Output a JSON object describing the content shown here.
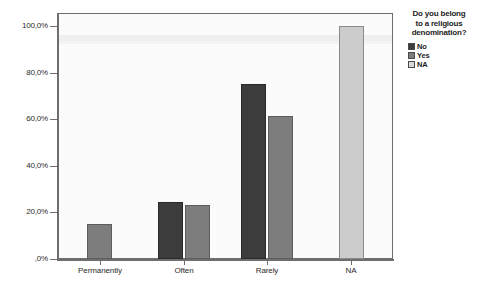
{
  "chart_data": {
    "type": "bar",
    "title": "",
    "xlabel": "",
    "ylabel": "",
    "categories": [
      "Permanently",
      "Often",
      "Rarely",
      "NA"
    ],
    "series": [
      {
        "name": "No",
        "color": "#3c3c3c",
        "values": [
          null,
          24.5,
          75.0,
          null
        ]
      },
      {
        "name": "Yes",
        "color": "#7d7d7d",
        "values": [
          15.0,
          23.0,
          61.5,
          null
        ]
      },
      {
        "name": "NA",
        "color": "#cccccc",
        "values": [
          null,
          null,
          null,
          100.0
        ]
      }
    ],
    "ylim": [
      0,
      100
    ],
    "yticks": [
      0,
      20,
      40,
      60,
      80,
      100
    ],
    "ytick_labels": [
      ",0%",
      "20,0%",
      "40,0%",
      "60,0%",
      "80,0%",
      "100,0%"
    ],
    "grid": false,
    "legend_position": "right"
  },
  "legend": {
    "title_lines": [
      "Do you belong",
      "to a religious",
      "denomination?"
    ],
    "entries": [
      {
        "label": "No",
        "color": "#3c3c3c"
      },
      {
        "label": "Yes",
        "color": "#7d7d7d"
      },
      {
        "label": "NA",
        "color": "#d8d8d8"
      }
    ]
  },
  "caption": ""
}
